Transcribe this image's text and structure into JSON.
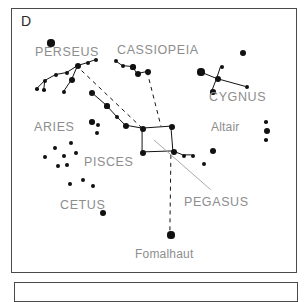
{
  "figure": {
    "panel_label": "D",
    "type": "star-chart",
    "background_color": "#ffffff",
    "star_color": "#111111",
    "label_color": "#8d8d8d",
    "border_color": "#4a4a4a"
  },
  "chart_data": {
    "type": "scatter",
    "title": "D",
    "xlabel": "",
    "ylabel": "",
    "xlim": [
      0,
      286
    ],
    "ylim": [
      0,
      265
    ],
    "grid": false,
    "legend": "none",
    "labels": [
      {
        "name": "label-perseus",
        "text": "PERSEUS",
        "x": 23,
        "y": 37,
        "size": 12.5
      },
      {
        "name": "label-cassiopeia",
        "text": "CASSIOPEIA",
        "x": 105,
        "y": 35,
        "size": 12.5
      },
      {
        "name": "label-cygnus",
        "text": "CYGNUS",
        "x": 197,
        "y": 82,
        "size": 12.5
      },
      {
        "name": "label-aries",
        "text": "ARIES",
        "x": 22,
        "y": 112,
        "size": 12.5
      },
      {
        "name": "label-altair",
        "text": "Altair",
        "x": 199,
        "y": 112,
        "size": 12,
        "style": "mixed"
      },
      {
        "name": "label-pisces",
        "text": "PISCES",
        "x": 72,
        "y": 147,
        "size": 12.5
      },
      {
        "name": "label-pegasus",
        "text": "PEGASUS",
        "x": 172,
        "y": 187,
        "size": 12.5
      },
      {
        "name": "label-cetus",
        "text": "CETUS",
        "x": 48,
        "y": 190,
        "size": 12.5
      },
      {
        "name": "label-fomalhaut",
        "text": "Fomalhaut",
        "x": 123,
        "y": 239,
        "size": 12,
        "style": "mixed"
      }
    ],
    "stars": [
      {
        "name": "star-perseus-mirfak-top",
        "x": 39,
        "y": 34,
        "r": 3.6
      },
      {
        "name": "star-perseus-hub",
        "x": 66,
        "y": 57,
        "r": 3.4
      },
      {
        "name": "star-perseus-a",
        "x": 55,
        "y": 64,
        "r": 2.2
      },
      {
        "name": "star-perseus-b",
        "x": 44,
        "y": 66,
        "r": 2.2
      },
      {
        "name": "star-perseus-c",
        "x": 33,
        "y": 72,
        "r": 2.0
      },
      {
        "name": "star-perseus-d",
        "x": 25,
        "y": 80,
        "r": 1.8
      },
      {
        "name": "star-perseus-e",
        "x": 32,
        "y": 81,
        "r": 1.8
      },
      {
        "name": "star-perseus-algol",
        "x": 60,
        "y": 71,
        "r": 3.2
      },
      {
        "name": "star-perseus-f",
        "x": 52,
        "y": 83,
        "r": 1.9
      },
      {
        "name": "star-perseus-g",
        "x": 76,
        "y": 54,
        "r": 2.0
      },
      {
        "name": "star-perseus-h",
        "x": 84,
        "y": 51,
        "r": 2.2
      },
      {
        "name": "star-andromeda-1",
        "x": 80,
        "y": 84,
        "r": 3.2
      },
      {
        "name": "star-andromeda-2",
        "x": 95,
        "y": 97,
        "r": 2.6
      },
      {
        "name": "star-andromeda-3",
        "x": 105,
        "y": 108,
        "r": 2.4
      },
      {
        "name": "star-andromeda-4",
        "x": 114,
        "y": 117,
        "r": 3.0
      },
      {
        "name": "star-cassiopeia-1",
        "x": 104,
        "y": 52,
        "r": 2.2
      },
      {
        "name": "star-cassiopeia-2",
        "x": 111,
        "y": 57,
        "r": 2.4
      },
      {
        "name": "star-cassiopeia-3",
        "x": 121,
        "y": 58,
        "r": 2.6
      },
      {
        "name": "star-cassiopeia-4",
        "x": 126,
        "y": 65,
        "r": 3.2
      },
      {
        "name": "star-cassiopeia-5",
        "x": 136,
        "y": 63,
        "r": 3.0
      },
      {
        "name": "star-loose-upper-right",
        "x": 231,
        "y": 44,
        "r": 3.2
      },
      {
        "name": "star-cygnus-deneb",
        "x": 189,
        "y": 63,
        "r": 3.6
      },
      {
        "name": "star-cygnus-center",
        "x": 206,
        "y": 70,
        "r": 3.2
      },
      {
        "name": "star-cygnus-top",
        "x": 210,
        "y": 58,
        "r": 2.0
      },
      {
        "name": "star-cygnus-lower",
        "x": 201,
        "y": 83,
        "r": 2.8
      },
      {
        "name": "star-cygnus-albireo",
        "x": 235,
        "y": 78,
        "r": 2.2
      },
      {
        "name": "star-altair-main",
        "x": 255,
        "y": 122,
        "r": 3.4
      },
      {
        "name": "star-altair-upper",
        "x": 254,
        "y": 113,
        "r": 1.8
      },
      {
        "name": "star-altair-lower",
        "x": 254,
        "y": 131,
        "r": 1.8
      },
      {
        "name": "star-square-nw",
        "x": 131,
        "y": 120,
        "r": 3.2
      },
      {
        "name": "star-square-ne",
        "x": 160,
        "y": 118,
        "r": 3.2
      },
      {
        "name": "star-square-sw",
        "x": 131,
        "y": 144,
        "r": 3.2
      },
      {
        "name": "star-square-se",
        "x": 162,
        "y": 143,
        "r": 3.4
      },
      {
        "name": "star-pegasus-east-1",
        "x": 172,
        "y": 147,
        "r": 2.2
      },
      {
        "name": "star-pegasus-east-2",
        "x": 181,
        "y": 147,
        "r": 2.0
      },
      {
        "name": "star-pegasus-east-3",
        "x": 192,
        "y": 155,
        "r": 2.0
      },
      {
        "name": "star-pegasus-east-4",
        "x": 201,
        "y": 142,
        "r": 3.2
      },
      {
        "name": "star-aries-1",
        "x": 80,
        "y": 113,
        "r": 2.8
      },
      {
        "name": "star-aries-2",
        "x": 86,
        "y": 116,
        "r": 2.2
      },
      {
        "name": "star-aries-3",
        "x": 85,
        "y": 124,
        "r": 2.0
      },
      {
        "name": "star-pisces-1",
        "x": 59,
        "y": 134,
        "r": 2.0
      },
      {
        "name": "star-pisces-2",
        "x": 43,
        "y": 139,
        "r": 1.9
      },
      {
        "name": "star-pisces-3",
        "x": 64,
        "y": 144,
        "r": 1.9
      },
      {
        "name": "star-pisces-4",
        "x": 52,
        "y": 147,
        "r": 1.9
      },
      {
        "name": "star-pisces-5",
        "x": 33,
        "y": 148,
        "r": 1.9
      },
      {
        "name": "star-pisces-6",
        "x": 55,
        "y": 156,
        "r": 1.9
      },
      {
        "name": "star-pisces-7",
        "x": 46,
        "y": 157,
        "r": 1.9
      },
      {
        "name": "star-cetus-1",
        "x": 58,
        "y": 175,
        "r": 1.9
      },
      {
        "name": "star-cetus-2",
        "x": 71,
        "y": 171,
        "r": 2.0
      },
      {
        "name": "star-cetus-3",
        "x": 81,
        "y": 177,
        "r": 1.9
      },
      {
        "name": "star-cetus-menkar",
        "x": 91,
        "y": 204,
        "r": 3.0
      },
      {
        "name": "star-fomalhaut",
        "x": 159,
        "y": 226,
        "r": 3.6
      }
    ],
    "solid_lines": [
      {
        "name": "line-perseus-hub-to-a",
        "x1": 66,
        "y1": 57,
        "x2": 55,
        "y2": 64
      },
      {
        "name": "line-perseus-a-to-b",
        "x1": 55,
        "y1": 64,
        "x2": 44,
        "y2": 66
      },
      {
        "name": "line-perseus-b-to-c",
        "x1": 44,
        "y1": 66,
        "x2": 33,
        "y2": 72
      },
      {
        "name": "line-perseus-c-to-d",
        "x1": 33,
        "y1": 72,
        "x2": 25,
        "y2": 80
      },
      {
        "name": "line-perseus-c-to-e",
        "x1": 33,
        "y1": 72,
        "x2": 32,
        "y2": 81
      },
      {
        "name": "line-perseus-hub-algol",
        "x1": 66,
        "y1": 57,
        "x2": 60,
        "y2": 71
      },
      {
        "name": "line-perseus-algol-f",
        "x1": 60,
        "y1": 71,
        "x2": 52,
        "y2": 83
      },
      {
        "name": "line-perseus-hub-to-g",
        "x1": 66,
        "y1": 57,
        "x2": 76,
        "y2": 54
      },
      {
        "name": "line-perseus-g-to-h",
        "x1": 76,
        "y1": 54,
        "x2": 84,
        "y2": 51
      },
      {
        "name": "line-and-1-to-2",
        "x1": 80,
        "y1": 84,
        "x2": 95,
        "y2": 97
      },
      {
        "name": "line-and-2-to-3",
        "x1": 95,
        "y1": 97,
        "x2": 105,
        "y2": 108
      },
      {
        "name": "line-and-3-to-4",
        "x1": 105,
        "y1": 108,
        "x2": 114,
        "y2": 117
      },
      {
        "name": "line-and-4-to-square-nw",
        "x1": 114,
        "y1": 117,
        "x2": 131,
        "y2": 120
      },
      {
        "name": "line-cas-1-to-2",
        "x1": 104,
        "y1": 52,
        "x2": 111,
        "y2": 57
      },
      {
        "name": "line-cas-2-to-3",
        "x1": 111,
        "y1": 57,
        "x2": 121,
        "y2": 58
      },
      {
        "name": "line-cas-3-to-4",
        "x1": 121,
        "y1": 58,
        "x2": 126,
        "y2": 65
      },
      {
        "name": "line-cas-4-to-5",
        "x1": 126,
        "y1": 65,
        "x2": 136,
        "y2": 63
      },
      {
        "name": "line-cyg-deneb-center",
        "x1": 189,
        "y1": 63,
        "x2": 206,
        "y2": 70
      },
      {
        "name": "line-cyg-center-top",
        "x1": 206,
        "y1": 70,
        "x2": 210,
        "y2": 58
      },
      {
        "name": "line-cyg-center-lower",
        "x1": 206,
        "y1": 70,
        "x2": 201,
        "y2": 83
      },
      {
        "name": "line-cyg-center-albireo",
        "x1": 206,
        "y1": 70,
        "x2": 235,
        "y2": 78
      },
      {
        "name": "line-square-top",
        "x1": 131,
        "y1": 120,
        "x2": 160,
        "y2": 118
      },
      {
        "name": "line-square-left",
        "x1": 131,
        "y1": 120,
        "x2": 131,
        "y2": 144
      },
      {
        "name": "line-square-bottom",
        "x1": 131,
        "y1": 144,
        "x2": 162,
        "y2": 143
      },
      {
        "name": "line-square-right",
        "x1": 160,
        "y1": 118,
        "x2": 162,
        "y2": 143
      },
      {
        "name": "line-pegasus-chain-1",
        "x1": 162,
        "y1": 143,
        "x2": 172,
        "y2": 147
      },
      {
        "name": "line-pegasus-chain-2",
        "x1": 172,
        "y1": 147,
        "x2": 181,
        "y2": 147
      }
    ],
    "dashed_lines": [
      {
        "name": "dashed-perseus-to-square",
        "x1": 70,
        "y1": 62,
        "x2": 131,
        "y2": 120
      },
      {
        "name": "dashed-cassiopeia-to-square",
        "x1": 136,
        "y1": 63,
        "x2": 150,
        "y2": 118
      },
      {
        "name": "dashed-square-to-fomalhaut",
        "x1": 160,
        "y1": 147,
        "x2": 159,
        "y2": 224
      }
    ],
    "leader_lines": [
      {
        "name": "leader-pegasus-label",
        "x1": 143,
        "y1": 132,
        "x2": 200,
        "y2": 182,
        "color": "#a0a0a0"
      }
    ]
  }
}
